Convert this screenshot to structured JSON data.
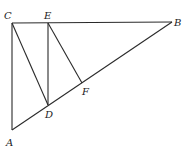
{
  "diagram": {
    "type": "geometry",
    "points": {
      "A": {
        "label": "A",
        "x": 12,
        "y": 130
      },
      "B": {
        "label": "B",
        "x": 172,
        "y": 22
      },
      "C": {
        "label": "C",
        "x": 12,
        "y": 23
      },
      "D": {
        "label": "D",
        "x": 48,
        "y": 105
      },
      "E": {
        "label": "E",
        "x": 48,
        "y": 23
      },
      "F": {
        "label": "F",
        "x": 82,
        "y": 83
      }
    },
    "segments": [
      "CB",
      "CA",
      "AB",
      "CD",
      "ED",
      "EF"
    ],
    "labels": {
      "A": "A",
      "B": "B",
      "C": "C",
      "D": "D",
      "E": "E",
      "F": "F"
    }
  }
}
